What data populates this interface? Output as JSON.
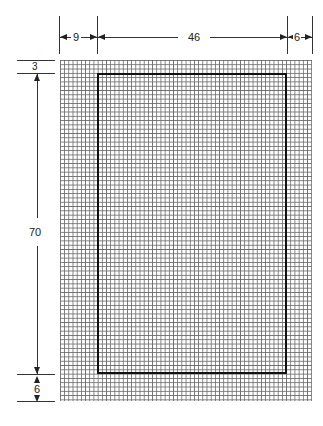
{
  "diagram": {
    "title": "",
    "dimensions": {
      "top": {
        "left_margin": "9",
        "content_width": "46",
        "right_margin": "6"
      },
      "left": {
        "top_margin": "3",
        "content_height": "70",
        "bottom_margin": "6"
      }
    },
    "elements": [
      {
        "id": "grid",
        "type": "graph-paper-grid"
      },
      {
        "id": "inner-rectangle",
        "type": "content-area-outline"
      }
    ],
    "colors": {
      "grid": "#555555",
      "outline": "#111111",
      "background": "#ffffff"
    }
  }
}
